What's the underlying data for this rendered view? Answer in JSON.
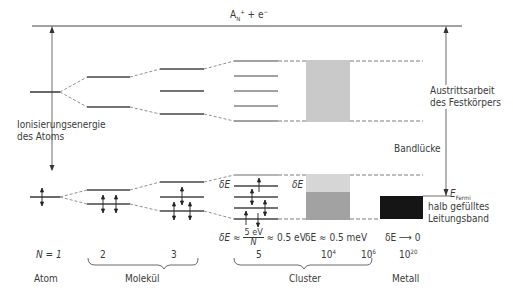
{
  "diagram": {
    "top_state": {
      "label_base": "A",
      "label_sub": "N",
      "label_sup": "+",
      "label_rest": " + e",
      "label_rest_sup": "−"
    },
    "left_arrow_label": {
      "line1": "Ionisierungsenergie",
      "line2": "des Atoms"
    },
    "right_arrow_label": {
      "line1": "Austrittsarbeit",
      "line2": "des Festkörpers"
    },
    "band_gap_label": "Bandlücke",
    "fermi_label": {
      "base": "E",
      "sub": "Fermi"
    },
    "conduction_label": {
      "line1": "halb gefülltes",
      "line2": "Leitungsband"
    },
    "delta_labels": {
      "cluster_small": "δE",
      "cluster_large": "δE",
      "formula_prefix": "δE ≈ ",
      "formula_num": "5 eV",
      "formula_den": "N",
      "formula_suffix": " ≈ 0.5 eV",
      "cluster_large_value": "δE ≈ 0.5 meV",
      "metal_value": "δE ⟶ 0"
    },
    "n_values": {
      "atom": "N = 1",
      "mol2": "2",
      "mol3": "3",
      "cluster5": "5",
      "cluster4_base": "10",
      "cluster4_exp": "4",
      "cluster6_base": "10",
      "cluster6_exp": "6",
      "metal_base": "10",
      "metal_exp": "20"
    },
    "categories": {
      "atom": "Atom",
      "molecule": "Molekül",
      "cluster": "Cluster",
      "metal": "Metall"
    }
  }
}
